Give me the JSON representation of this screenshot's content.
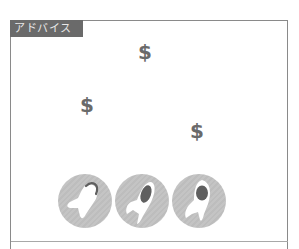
{
  "panel": {
    "label": "アドバイス"
  },
  "dollars": [
    {
      "symbol": "$",
      "name": "dollar-icon-top"
    },
    {
      "symbol": "$",
      "name": "dollar-icon-left"
    },
    {
      "symbol": "$",
      "name": "dollar-icon-right"
    }
  ],
  "icons": [
    {
      "name": "rocket-launch-icon"
    },
    {
      "name": "rocket-icon"
    },
    {
      "name": "rocket-upright-icon"
    }
  ],
  "colors": {
    "label_bg": "#6a6a6a",
    "label_text": "#e8e8e8",
    "frame_border": "#8a8a8a",
    "circle_bg": "#c4c4c4",
    "rocket_window": "#5f5f5f",
    "dollar": "#6a6a6a"
  }
}
